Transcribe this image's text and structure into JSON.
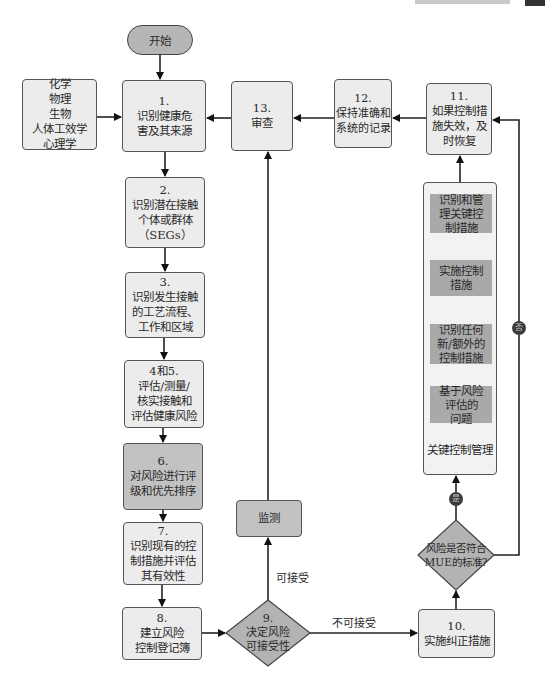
{
  "diagram": {
    "start": {
      "label": "开始"
    },
    "hazard_types": {
      "lines": [
        "化学",
        "物理",
        "生物",
        "人体工效学",
        "心理学"
      ]
    },
    "steps": {
      "s1": {
        "number": "1.",
        "lines": [
          "识别健康危",
          "害及其来源"
        ]
      },
      "s2": {
        "number": "2.",
        "lines": [
          "识别潜在接触",
          "个体或群体",
          "（SEGs）"
        ]
      },
      "s3": {
        "number": "3.",
        "lines": [
          "识别发生接触",
          "的工艺流程、",
          "工作和区域"
        ]
      },
      "s45": {
        "number": "4和5.",
        "lines": [
          "评估/测量/",
          "核实接触和",
          "评估健康风险"
        ]
      },
      "s6": {
        "number": "6.",
        "lines": [
          "对风险进行评",
          "级和优先排序"
        ]
      },
      "s7": {
        "number": "7.",
        "lines": [
          "识别现有的控",
          "制措施并评估",
          "其有效性"
        ]
      },
      "s8": {
        "number": "8.",
        "lines": [
          "建立风险",
          "控制登记簿"
        ]
      },
      "s9": {
        "number": "9.",
        "lines": [
          "决定风险",
          "可接受性"
        ]
      },
      "s10": {
        "number": "10.",
        "lines": [
          "实施纠正措施"
        ]
      },
      "s11": {
        "number": "11.",
        "lines": [
          "如果控制措",
          "施失效，及",
          "时恢复"
        ]
      },
      "s12": {
        "number": "12.",
        "lines": [
          "保持准确和",
          "系统的记录"
        ]
      },
      "s13": {
        "number": "13.",
        "lines": [
          "审查"
        ]
      }
    },
    "monitor": {
      "label": "监测"
    },
    "mue_decision": {
      "lines": [
        "风险是否符合",
        "MUE的标准?"
      ]
    },
    "key_control": {
      "title": "关键控制管理",
      "items": [
        {
          "lines": [
            "识别和管",
            "理关键控",
            "制措施"
          ]
        },
        {
          "lines": [
            "实施控制",
            "措施"
          ]
        },
        {
          "lines": [
            "识别任何",
            "新/额外的",
            "控制措施"
          ]
        },
        {
          "lines": [
            "基于风险",
            "评估的",
            "问题"
          ]
        }
      ]
    },
    "edge_labels": {
      "acceptable": "可接受",
      "unacceptable": "不可接受",
      "yes": "是",
      "no": "否"
    },
    "colors": {
      "light_box": "#ececec",
      "dark_box": "#c2c2c2",
      "inner_box": "#a9a9a9",
      "diamond": "#b3b3b3",
      "line": "#222222"
    }
  }
}
